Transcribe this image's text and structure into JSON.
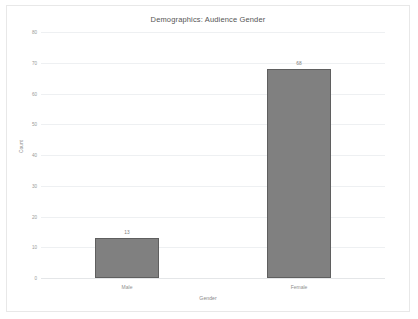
{
  "chart_data": {
    "type": "bar",
    "title": "Demographics: Audience Gender",
    "xlabel": "Gender",
    "ylabel": "Count",
    "categories": [
      "Male",
      "Female"
    ],
    "values": [
      13,
      68
    ],
    "value_labels": [
      "13",
      "68"
    ],
    "ylim": [
      0,
      80
    ],
    "ytick_step": 10,
    "yticks": [
      0,
      10,
      20,
      30,
      40,
      50,
      60,
      70,
      80
    ],
    "ytick_labels": [
      "0",
      "10",
      "20",
      "30",
      "40",
      "50",
      "60",
      "70",
      "80"
    ],
    "grid": true,
    "legend": false,
    "bar_color": "#808080",
    "bar_edge_color": "#5f5f5f",
    "gridline_color": "#eef0f2",
    "frame_color": "#e8e8e8",
    "background": "#ffffff"
  }
}
